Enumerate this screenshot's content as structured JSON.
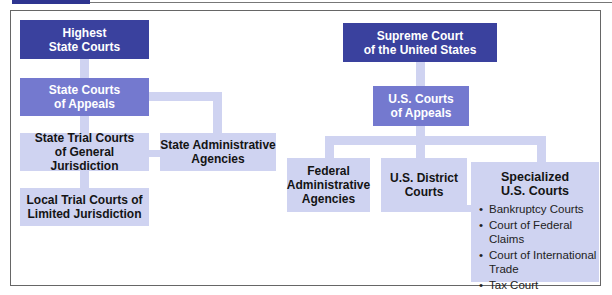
{
  "diagram": {
    "state": {
      "highest": "Highest\nState Courts",
      "appeals": "State Courts\nof Appeals",
      "trial_general": "State Trial Courts\nof General Jurisdiction",
      "admin": "State Administrative\nAgencies",
      "local_trial": "Local Trial Courts of\nLimited Jurisdiction"
    },
    "federal": {
      "supreme": "Supreme Court\nof the United States",
      "appeals": "U.S. Courts\nof Appeals",
      "admin": "Federal\nAdministrative\nAgencies",
      "district": "U.S. District\nCourts",
      "specialized": {
        "title": "Specialized\nU.S. Courts",
        "items": [
          "Bankruptcy Courts",
          "Court of Federal Claims",
          "Court of International Trade",
          "Tax Court"
        ]
      }
    },
    "colors": {
      "dark": "#3a419e",
      "mid": "#7479cf",
      "light": "#cfd3f1"
    }
  }
}
